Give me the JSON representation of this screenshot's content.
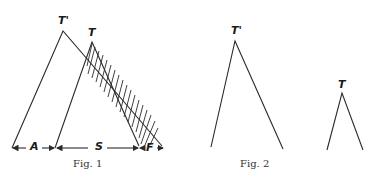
{
  "figures": [
    {
      "caption": "Fig. 1",
      "labels": {
        "apex_outer": "T'",
        "apex_inner": "T",
        "segment_a": "A",
        "segment_s": "S",
        "segment_f": "F"
      }
    },
    {
      "caption": "Fig. 2",
      "labels": {
        "apex_large": "T'",
        "apex_small": "T"
      }
    }
  ],
  "colors": {
    "ink": "#2a2a2a",
    "background": "#ffffff"
  }
}
